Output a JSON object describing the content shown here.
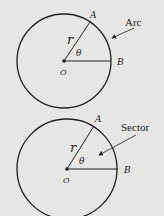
{
  "figures": [
    {
      "name": "arc-figure",
      "callout": "Arc",
      "points": {
        "A": "A",
        "B": "B",
        "O": "O"
      },
      "radius_label": "r",
      "angle_label": "θ"
    },
    {
      "name": "sector-figure",
      "callout": "Sector",
      "points": {
        "A": "A",
        "B": "B",
        "O": "O"
      },
      "radius_label": "r",
      "angle_label": "θ"
    }
  ],
  "colors": {
    "background": "#e6e6e4",
    "stroke": "#222222"
  }
}
